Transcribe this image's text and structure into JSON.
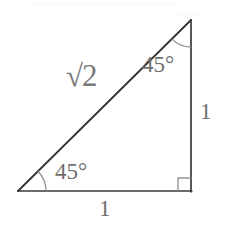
{
  "figure": {
    "canvas": {
      "width": 227,
      "height": 227,
      "background": "#ffffff"
    },
    "colors": {
      "leg_stroke": "#3a3a3a",
      "hypotenuse_stroke": "#333333",
      "arc_stroke": "#8f8f8f",
      "right_angle_stroke": "#959595",
      "label_text": "#6f6f6f",
      "hypotenuse_label_text": "#7a7a7a"
    },
    "vertices": {
      "bottom_left": {
        "x": 18,
        "y": 191
      },
      "bottom_right": {
        "x": 191,
        "y": 191
      },
      "top": {
        "x": 191,
        "y": 20
      }
    },
    "sides": [
      {
        "name": "horizontal-leg",
        "from": "bottom_left",
        "to": "bottom_right",
        "label": "1"
      },
      {
        "name": "vertical-leg",
        "from": "bottom_right",
        "to": "top",
        "label": "1"
      },
      {
        "name": "hypotenuse",
        "from": "bottom_left",
        "to": "top",
        "label": "√2"
      }
    ],
    "angles": [
      {
        "name": "angle-bottom-left",
        "label": "45°",
        "value": 45,
        "unit": "degrees",
        "arc_radius": 28
      },
      {
        "name": "angle-top",
        "label": "45°",
        "value": 45,
        "unit": "degrees",
        "arc_radius": 27
      },
      {
        "name": "angle-bottom-right",
        "label": "",
        "value": 90,
        "unit": "degrees",
        "marker": "right-angle-square",
        "marker_size": 13
      }
    ],
    "labels": {
      "hypotenuse_radical_sign": "√",
      "hypotenuse_radicand": "2",
      "hypotenuse_full": "√2",
      "angle_top": "45°",
      "angle_bottom_left": "45°",
      "leg_vertical": "1",
      "leg_horizontal": "1"
    }
  }
}
